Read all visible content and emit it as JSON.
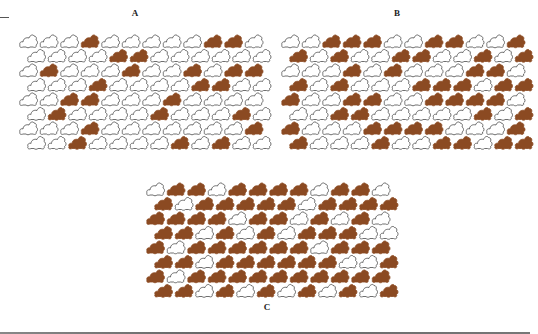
{
  "figure": {
    "colors": {
      "filled": "#8B4A22",
      "outline": "#4a4a4a",
      "background": "#ffffff"
    },
    "panels": [
      {
        "label": "A",
        "label_x": 135,
        "label_y": 8,
        "x": 18,
        "y": 34,
        "rows": [
          "000100000110",
          "000011000000",
          "010001001011",
          "000100001100",
          "001100010000",
          "010000100010",
          "000100000001",
          "001000010100"
        ]
      },
      {
        "label": "B",
        "label_x": 397,
        "label_y": 8,
        "x": 280,
        "y": 34,
        "rows": [
          "001110011001",
          "101001100101",
          "000101000110",
          "101000111011",
          "100110011110",
          "001100000101",
          "100011110001",
          "100010011011"
        ]
      },
      {
        "label": "C",
        "label_x": 267,
        "label_y": 302,
        "x": 145,
        "y": 182,
        "rows": [
          "011011110110",
          "101111101111",
          "111101101010",
          "110101011100",
          "101111110111",
          "110111111001",
          "101111111111",
          "110101010101"
        ]
      }
    ]
  }
}
